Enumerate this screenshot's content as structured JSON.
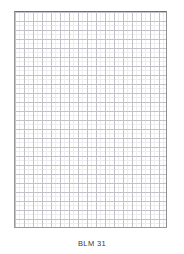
{
  "page": {
    "background_color": "#ffffff",
    "width": 184,
    "height": 254
  },
  "grid": {
    "name": "blank-grid-paper",
    "border_color": "#8d8d91",
    "major_line_color": "#c2c2c8",
    "minor_line_color": "#ededf0",
    "major_cell_px": 9,
    "minor_subdivisions": 2,
    "columns": 17,
    "rows": 24,
    "fill_color": "#ffffff"
  },
  "caption": {
    "text": "BLM 31",
    "color": "#3a3a3c"
  }
}
